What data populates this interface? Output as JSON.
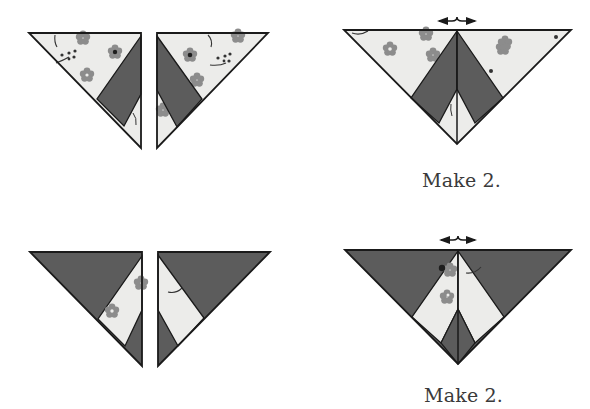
{
  "diagram": {
    "type": "quilt-block-assembly",
    "colors": {
      "dark": "#5c5c5c",
      "light": "#ececea",
      "print": "#8c8c8c",
      "print_center": "#1e1e1e",
      "outline": "#1a1a1a"
    },
    "rows": [
      {
        "name": "row-1-light-corner-units",
        "units": [
          "left-half-triangle-light",
          "right-half-triangle-light"
        ],
        "result": "combined-triangle-light-outer",
        "press_arrow": "double-arrow",
        "caption": "Make 2."
      },
      {
        "name": "row-2-dark-corner-units",
        "units": [
          "left-half-triangle-dark",
          "right-half-triangle-dark"
        ],
        "result": "combined-triangle-dark-outer",
        "press_arrow": "double-arrow",
        "caption": "Make 2."
      }
    ]
  },
  "captions": {
    "top": "Make 2.",
    "bottom": "Make 2."
  }
}
